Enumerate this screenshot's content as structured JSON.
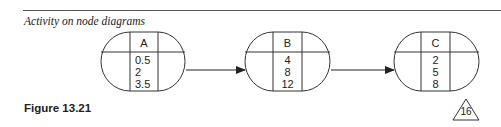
{
  "header": {
    "section_title": "Activity on node diagrams"
  },
  "diagram": {
    "nodes": [
      {
        "id": "A",
        "label": "A",
        "values": [
          "0.5",
          "2",
          "3.5"
        ]
      },
      {
        "id": "B",
        "label": "B",
        "values": [
          "4",
          "8",
          "12"
        ]
      },
      {
        "id": "C",
        "label": "C",
        "values": [
          "2",
          "5",
          "8"
        ]
      }
    ],
    "edges": [
      {
        "from": "A",
        "to": "B"
      },
      {
        "from": "B",
        "to": "C"
      }
    ]
  },
  "footer": {
    "figure_caption": "Figure 13.21",
    "page_number": "16"
  }
}
